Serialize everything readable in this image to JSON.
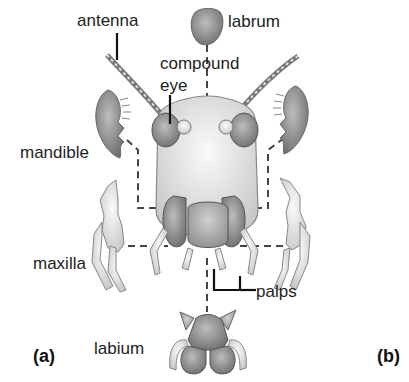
{
  "figure": {
    "labels": {
      "antenna": "antenna",
      "labrum": "labrum",
      "compound_eye": "compound eye",
      "compound_eye_line1": "compound",
      "compound_eye_line2": "eye",
      "mandible": "mandible",
      "maxilla": "maxilla",
      "palps": "palps",
      "labium": "labium"
    },
    "panels": {
      "a": "(a)",
      "b": "(b)"
    },
    "colors": {
      "line": "#111111",
      "dash": "#444444",
      "part_dark": "#8a8a8a",
      "part_light": "#d8d8d8",
      "outline": "#555555"
    }
  }
}
